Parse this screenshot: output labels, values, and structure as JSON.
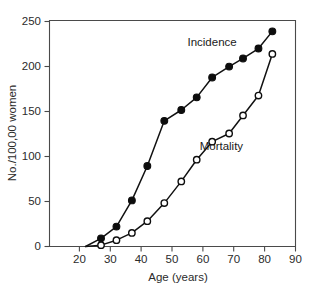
{
  "chart_data": {
    "type": "line",
    "title": "",
    "xlabel": "Age (years)",
    "ylabel": "No./100,00 women",
    "xlim": [
      13,
      90
    ],
    "ylim": [
      0,
      250
    ],
    "xticks": [
      20,
      30,
      40,
      50,
      60,
      70,
      80,
      90
    ],
    "xtick_labels": [
      "20",
      "30",
      "40",
      "50",
      "60",
      "70",
      "80",
      "90"
    ],
    "yticks": [
      0,
      50,
      100,
      150,
      200,
      250
    ],
    "ytick_labels": [
      "0",
      "50",
      "100",
      "150",
      "200",
      "250"
    ],
    "grid": false,
    "legend_position": "inline-annotation",
    "series": [
      {
        "name": "Incidence",
        "marker": "filled-circle",
        "color": "#0d0d0d",
        "x": [
          22,
          27,
          32,
          37,
          42,
          47.5,
          53,
          58,
          63,
          68.5,
          73,
          78,
          82.5
        ],
        "values": [
          0,
          9,
          22,
          51,
          89,
          139,
          151,
          165,
          187,
          199,
          208,
          219,
          238
        ]
      },
      {
        "name": "Mortality",
        "marker": "open-circle",
        "color": "#0d0d0d",
        "x": [
          22,
          27,
          32,
          37,
          42,
          47.5,
          53,
          58,
          63,
          68.5,
          73,
          78,
          82.5
        ],
        "values": [
          0,
          1.5,
          7,
          15,
          28,
          48,
          72,
          96,
          116,
          125,
          145,
          167,
          213
        ]
      }
    ],
    "annotations": [
      {
        "text": "Incidence",
        "x": 63,
        "y": 222
      },
      {
        "text": "Mortality",
        "x": 66,
        "y": 107
      }
    ]
  }
}
